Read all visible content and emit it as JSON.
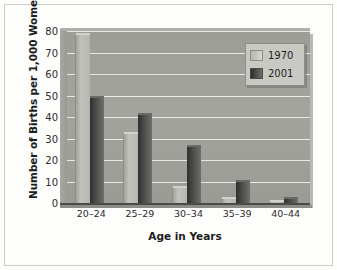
{
  "chart_data": {
    "type": "bar",
    "title": "",
    "xlabel": "Age in Years",
    "ylabel": "Number of Births per 1,000 Women",
    "categories": [
      "20–24",
      "25–29",
      "30–34",
      "35–39",
      "40–44"
    ],
    "series": [
      {
        "name": "1970",
        "values": [
          78,
          32,
          7,
          2,
          0.3
        ],
        "color": "#c2c2bd"
      },
      {
        "name": "2001",
        "values": [
          49,
          41,
          26,
          10,
          2
        ],
        "color": "#3a3a38"
      }
    ],
    "ylim": [
      0,
      80
    ],
    "yticks": [
      0,
      10,
      20,
      30,
      40,
      50,
      60,
      70,
      80
    ],
    "ytick_labels": [
      "0",
      "10",
      "20",
      "30",
      "40",
      "50",
      "60",
      "70",
      "80"
    ],
    "grid": true,
    "legend_position": "top-right",
    "legend_entries": [
      "1970",
      "2001"
    ]
  }
}
